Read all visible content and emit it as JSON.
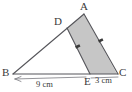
{
  "figure": {
    "type": "geometry-diagram",
    "background_color": "#ffffff",
    "stroke_color": "#55555a",
    "shade_color": "#c6c6c6",
    "text_color": "#3a3a3a",
    "points": {
      "A": {
        "label": "A",
        "x": 84,
        "y": 14
      },
      "B": {
        "label": "B",
        "x": 13,
        "y": 74
      },
      "C": {
        "label": "C",
        "x": 118,
        "y": 74
      },
      "D": {
        "label": "D",
        "x": 67,
        "y": 28
      },
      "E": {
        "label": "E",
        "x": 90,
        "y": 74
      }
    },
    "shaded_region": {
      "name": "quadrilateral-ADEC",
      "vertices": "A,D,E,C"
    },
    "parallel_marks": [
      {
        "on": "DE",
        "count": 1
      },
      {
        "on": "AC",
        "count": 1
      }
    ],
    "dimensions": [
      {
        "name": "BE",
        "value": "9 cm",
        "from": "B",
        "to": "E"
      },
      {
        "name": "EC",
        "value": "3 cm",
        "from": "E",
        "to": "C"
      }
    ]
  }
}
